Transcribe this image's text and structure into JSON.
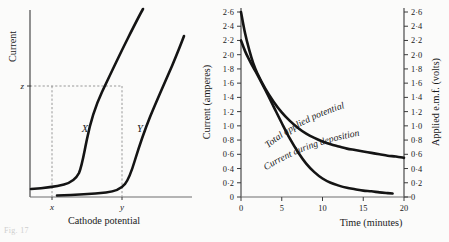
{
  "figure": {
    "caption_fragment": "Fig. 17"
  },
  "left_panel": {
    "y_axis_title": "Current",
    "x_axis_title": "Cathode potential",
    "y_mark": "z",
    "x_marks": [
      "x",
      "y"
    ],
    "curve_labels": [
      "X",
      "Y"
    ]
  },
  "right_panel": {
    "y_axis_title": "Current (amperes)",
    "y2_axis_title": "Applied e.m.f. (volts)",
    "x_axis_title": "Time (minutes)",
    "curve_label_upper": "Total applied potential",
    "curve_label_lower": "Current during deposition"
  },
  "chart_data": [
    {
      "type": "line",
      "title": "Current vs cathode potential",
      "xlabel": "Cathode potential",
      "ylabel": "Current",
      "grid": false,
      "legend": "inline-curve-labels",
      "xticks": [],
      "xtick_labels": [
        "x",
        "y"
      ],
      "ytick_labels": [
        "z"
      ],
      "annotations": [
        {
          "text": "z",
          "axis": "y",
          "note": "horizontal dashed line at decomposition current level"
        },
        {
          "text": "x",
          "axis": "x",
          "note": "decomposition potential of curve X"
        },
        {
          "text": "y",
          "axis": "x",
          "note": "decomposition potential of curve Y"
        }
      ],
      "series": [
        {
          "name": "X",
          "note": "metal X polarisation curve, decomposition potential x",
          "points": [
            [
              0.02,
              0.035
            ],
            [
              0.1,
              0.04
            ],
            [
              0.18,
              0.046
            ],
            [
              0.24,
              0.052
            ],
            [
              0.28,
              0.06
            ],
            [
              0.305,
              0.075
            ],
            [
              0.32,
              0.105
            ],
            [
              0.335,
              0.17
            ],
            [
              0.35,
              0.27
            ],
            [
              0.375,
              0.4
            ],
            [
              0.41,
              0.54
            ],
            [
              0.46,
              0.655
            ],
            [
              0.52,
              0.76
            ],
            [
              0.6,
              0.875
            ],
            [
              0.68,
              0.975
            ],
            [
              0.74,
              1.03
            ]
          ]
        },
        {
          "name": "Y",
          "note": "metal Y polarisation curve, decomposition potential y",
          "points": [
            [
              0.17,
              0.01
            ],
            [
              0.3,
              0.014
            ],
            [
              0.42,
              0.02
            ],
            [
              0.5,
              0.028
            ],
            [
              0.545,
              0.04
            ],
            [
              0.575,
              0.065
            ],
            [
              0.6,
              0.115
            ],
            [
              0.625,
              0.2
            ],
            [
              0.655,
              0.305
            ],
            [
              0.7,
              0.43
            ],
            [
              0.76,
              0.56
            ],
            [
              0.83,
              0.695
            ],
            [
              0.9,
              0.8
            ],
            [
              0.955,
              0.875
            ]
          ]
        }
      ]
    },
    {
      "type": "line",
      "title": "Electrolytic deposition: current and applied e.m.f. vs time",
      "xlabel": "Time (minutes)",
      "ylabel": "Current (amperes)",
      "y2label": "Applied e.m.f. (volts)",
      "grid": false,
      "xlim": [
        0,
        20
      ],
      "ylim": [
        0,
        2.6
      ],
      "y2lim": [
        0,
        2.6
      ],
      "xticks": [
        0,
        5,
        10,
        15,
        20
      ],
      "xtick_labels": [
        "0",
        "5",
        "10",
        "15",
        "20"
      ],
      "yticks": [
        0,
        0.2,
        0.4,
        0.6,
        0.8,
        1.0,
        1.2,
        1.4,
        1.6,
        1.8,
        2.0,
        2.2,
        2.4,
        2.6
      ],
      "ytick_labels": [
        "0",
        "0·2",
        "0·4",
        "0·6",
        "0·8",
        "1·0",
        "1·2",
        "1·4",
        "1·6",
        "1·8",
        "2·0",
        "2·2",
        "2·4",
        "2·6"
      ],
      "y2ticks": [
        0,
        0.2,
        0.4,
        0.6,
        0.8,
        1.0,
        1.2,
        1.4,
        1.6,
        1.8,
        2.0,
        2.2,
        2.4,
        2.6
      ],
      "y2tick_labels": [
        "0",
        "0·2",
        "0·4",
        "0·6",
        "0·8",
        "1·0",
        "1·2",
        "1·4",
        "1·6",
        "1·8",
        "2·0",
        "2·2",
        "2·4",
        "2·6"
      ],
      "series": [
        {
          "name": "Total applied potential",
          "unit": "volts",
          "axis": "y2",
          "points": [
            [
              0.0,
              2.6
            ],
            [
              0.5,
              2.3
            ],
            [
              1.0,
              2.07
            ],
            [
              1.5,
              1.88
            ],
            [
              2.0,
              1.74
            ],
            [
              3.0,
              1.52
            ],
            [
              4.0,
              1.34
            ],
            [
              5.0,
              1.19
            ],
            [
              6.0,
              1.07
            ],
            [
              7.0,
              0.97
            ],
            [
              8.0,
              0.89
            ],
            [
              9.0,
              0.83
            ],
            [
              10.0,
              0.78
            ],
            [
              11.0,
              0.74
            ],
            [
              12.0,
              0.71
            ],
            [
              13.0,
              0.68
            ],
            [
              14.0,
              0.66
            ],
            [
              15.0,
              0.64
            ],
            [
              16.0,
              0.62
            ],
            [
              17.0,
              0.6
            ],
            [
              18.0,
              0.58
            ],
            [
              19.0,
              0.57
            ],
            [
              20.0,
              0.55
            ]
          ]
        },
        {
          "name": "Current during deposition",
          "unit": "amperes",
          "axis": "y",
          "points": [
            [
              0.0,
              2.2
            ],
            [
              0.5,
              2.05
            ],
            [
              1.0,
              1.93
            ],
            [
              1.5,
              1.82
            ],
            [
              2.0,
              1.72
            ],
            [
              3.0,
              1.5
            ],
            [
              4.0,
              1.27
            ],
            [
              5.0,
              1.04
            ],
            [
              6.0,
              0.82
            ],
            [
              7.0,
              0.63
            ],
            [
              8.0,
              0.47
            ],
            [
              9.0,
              0.35
            ],
            [
              10.0,
              0.26
            ],
            [
              11.0,
              0.2
            ],
            [
              12.0,
              0.16
            ],
            [
              13.0,
              0.13
            ],
            [
              14.0,
              0.11
            ],
            [
              15.0,
              0.09
            ],
            [
              16.0,
              0.08
            ],
            [
              17.0,
              0.065
            ],
            [
              18.0,
              0.055
            ],
            [
              18.6,
              0.05
            ]
          ]
        }
      ]
    }
  ]
}
